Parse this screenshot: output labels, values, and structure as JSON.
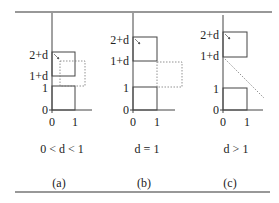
{
  "figure": {
    "panels": [
      {
        "id": "a",
        "caption": "0 < d < 1",
        "sublabel": "(a)",
        "y_ticks": [
          "2+d",
          "1+d",
          "1",
          "0"
        ],
        "x_ticks": [
          "0",
          "1"
        ]
      },
      {
        "id": "b",
        "caption": "d = 1",
        "sublabel": "(b)",
        "y_ticks": [
          "2+d",
          "1+d",
          "1",
          "0"
        ],
        "x_ticks": [
          "0",
          "1"
        ]
      },
      {
        "id": "c",
        "caption": "d > 1",
        "sublabel": "(c)",
        "y_ticks": [
          "2+d",
          "1+d",
          "1",
          "0"
        ],
        "x_ticks": [
          "0",
          "1"
        ]
      }
    ],
    "colors": {
      "line": "#444444",
      "dotted": "#777777",
      "text": "#222222"
    }
  }
}
